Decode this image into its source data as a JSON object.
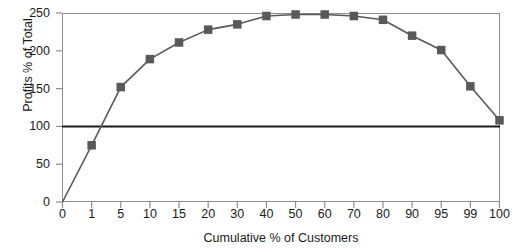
{
  "chart_data": {
    "type": "line",
    "title": "",
    "xlabel": "Cumulative % of Customers",
    "ylabel": "Profits % of Total",
    "x": [
      0,
      1,
      5,
      10,
      15,
      20,
      30,
      40,
      50,
      60,
      70,
      80,
      90,
      95,
      99,
      100
    ],
    "values": [
      0,
      75,
      152,
      189,
      211,
      228,
      235,
      246,
      248,
      248,
      246,
      241,
      220,
      201,
      153,
      108
    ],
    "xtick_labels": [
      "0",
      "1",
      "5",
      "10",
      "15",
      "20",
      "30",
      "40",
      "50",
      "60",
      "70",
      "80",
      "90",
      "95",
      "99",
      "100"
    ],
    "ytick_labels": [
      "0",
      "50",
      "100",
      "150",
      "200",
      "250"
    ],
    "yticks": [
      0,
      50,
      100,
      150,
      200,
      250
    ],
    "ylim": [
      0,
      250
    ],
    "grid": false,
    "legend": null,
    "reference_line": {
      "name": "100-percent-line",
      "y": 100,
      "color": "#1a1a1a"
    },
    "series_name": "Whale curve",
    "colors": {
      "line": "#595959",
      "marker": "#595959",
      "axis": "#8e8e8e",
      "text": "#1a1a1a",
      "background": "#ffffff"
    },
    "marker": "square"
  }
}
